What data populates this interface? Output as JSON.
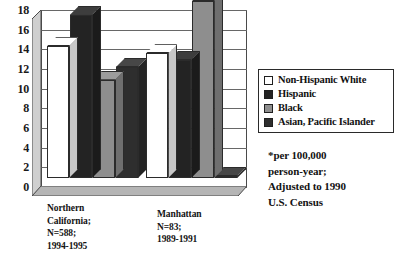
{
  "chart_data": {
    "type": "bar",
    "title": "",
    "subtitle": "",
    "xlabel": "",
    "ylabel": "",
    "ylim": [
      0,
      18
    ],
    "ytick_step": 2,
    "yticks": [
      18,
      16,
      14,
      12,
      10,
      8,
      6,
      4,
      2,
      0
    ],
    "grid": true,
    "legend_position": "right",
    "style": "3d-bar",
    "categories": [
      "Northern\nCalifornia;\nN=588;\n1994-1995",
      "Manhattan\nN=83;\n1989-1991"
    ],
    "series": [
      {
        "name": "Non-Hispanic White",
        "color": "#ffffff",
        "values": [
          13.4,
          12.7
        ]
      },
      {
        "name": "Hispanic",
        "color": "#232323",
        "values": [
          16.6,
          12.0
        ]
      },
      {
        "name": "Black",
        "color": "#8e8e8e",
        "values": [
          10.0,
          18.0
        ]
      },
      {
        "name": "Asian, Pacific Islander",
        "color": "#2e2e2e",
        "values": [
          11.3,
          0.15
        ]
      }
    ],
    "annotations": [
      "*per 100,000\nperson-year;\nAdjusted to 1990\nU.S. Census"
    ]
  },
  "legend": {
    "items": [
      {
        "label": "Non-Hispanic White",
        "color": "#ffffff"
      },
      {
        "label": "Hispanic",
        "color": "#232323"
      },
      {
        "label": "Black",
        "color": "#8e8e8e"
      },
      {
        "label": "Asian, Pacific Islander",
        "color": "#2e2e2e"
      }
    ]
  },
  "footnote": {
    "text": "*per 100,000\nperson-year;\nAdjusted to 1990\nU.S. Census"
  },
  "axis": {
    "y_labels": [
      "18",
      "16",
      "14",
      "12",
      "10",
      "8",
      "6",
      "4",
      "2",
      "0"
    ]
  },
  "colors": {
    "grid": "#676767",
    "frame": "#4a4a4a",
    "text": "#121212",
    "wall": "#c9c9c9"
  }
}
